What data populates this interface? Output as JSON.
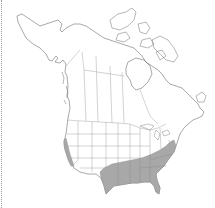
{
  "map": {
    "type": "species-range-map",
    "region": "North America",
    "background_color": "#ffffff",
    "outline_color": "#6e6e6e",
    "range_fill_color": "#a8a8a8",
    "range_regions": [
      "southeastern-united-states",
      "california-coast"
    ],
    "left_edge_style": "dotted"
  }
}
